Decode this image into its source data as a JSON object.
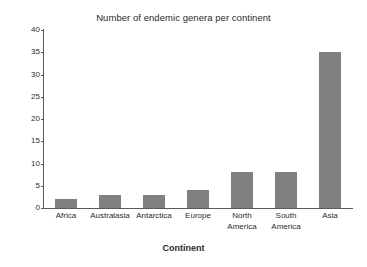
{
  "chart_data": {
    "type": "bar",
    "title": "Number of endemic genera per continent",
    "xlabel": "Continent",
    "ylabel": "Number of Endemic Genera",
    "categories": [
      "Africa",
      "Australasia",
      "Antarctica",
      "Europe",
      "North America",
      "South America",
      "Asia"
    ],
    "category_lines": [
      [
        "Africa"
      ],
      [
        "Australasia"
      ],
      [
        "Antarctica"
      ],
      [
        "Europe"
      ],
      [
        "North",
        "America"
      ],
      [
        "South",
        "America"
      ],
      [
        "Asia"
      ]
    ],
    "values": [
      2,
      3,
      3,
      4,
      8,
      8,
      35
    ],
    "ylim": [
      0,
      40
    ],
    "yticks": [
      0,
      5,
      10,
      15,
      20,
      25,
      30,
      35,
      40
    ],
    "ytick_labels": [
      "0",
      "5",
      "10",
      "15",
      "20",
      "25",
      "30",
      "35",
      "40"
    ],
    "grid": false,
    "legend": false,
    "bar_color": "#808080",
    "axis_color": "#5a5a5a",
    "background_color": "#ffffff",
    "text_color": "#2b2b2b"
  }
}
